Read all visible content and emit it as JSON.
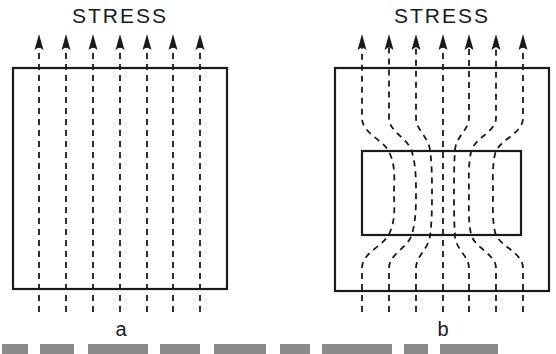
{
  "panels": [
    {
      "id": "a",
      "title": "STRESS",
      "label": "a",
      "description": "Uniform stress field: straight, parallel flux lines through a homogeneous block"
    },
    {
      "id": "b",
      "title": "STRESS",
      "label": "b",
      "description": "Stress lines deflected and concentrated through an embedded rectangular inclusion"
    }
  ],
  "caption": {
    "visible_text": "",
    "note": "caption line present but cropped at bottom edge"
  },
  "colors": {
    "ink": "#1a1a1a",
    "background": "#ffffff"
  }
}
